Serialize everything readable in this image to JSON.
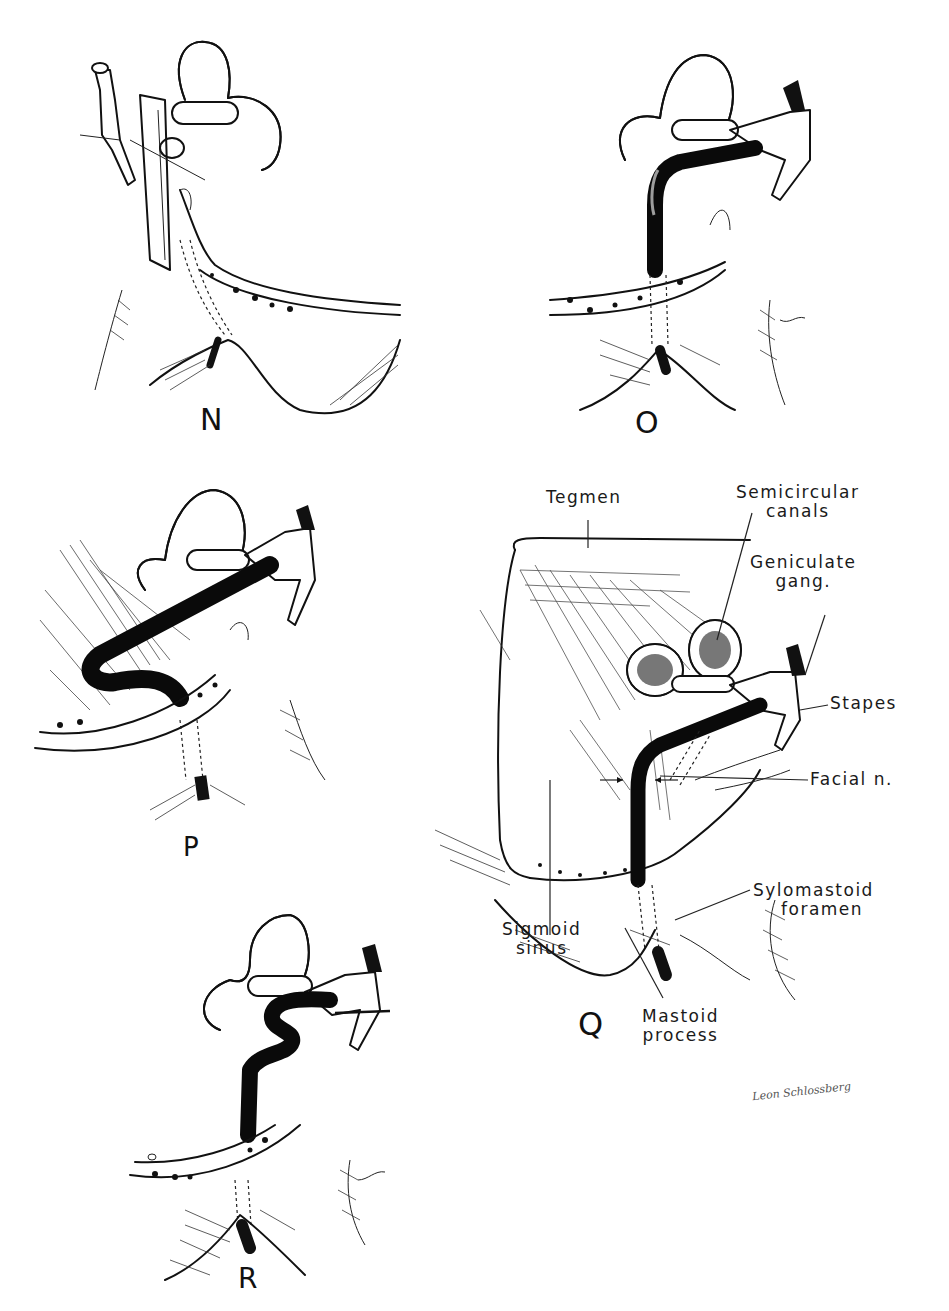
{
  "figure": {
    "panels": [
      {
        "id": "N",
        "letter": "N"
      },
      {
        "id": "O",
        "letter": "O"
      },
      {
        "id": "P",
        "letter": "P"
      },
      {
        "id": "Q",
        "letter": "Q"
      },
      {
        "id": "R",
        "letter": "R"
      }
    ],
    "q_labels": {
      "tegmen": "Tegmen",
      "semicircular_1": "Semicircular",
      "semicircular_2": "canals",
      "geniculate_1": "Geniculate",
      "geniculate_2": "gang.",
      "stapes": "Stapes",
      "facial": "Facial n.",
      "stylomastoid_1": "Sylomastoid",
      "stylomastoid_2": "foramen",
      "sigmoid_1": "Sigmoid",
      "sigmoid_2": "sinus",
      "mastoid_1": "Mastoid",
      "mastoid_2": "process"
    },
    "signature": "Leon Schlossberg"
  }
}
